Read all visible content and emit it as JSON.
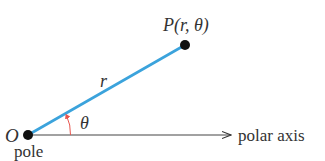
{
  "diagram": {
    "pole": {
      "label": "O",
      "caption": "pole",
      "x": 28,
      "y": 135
    },
    "point": {
      "label": "P(r, θ)",
      "x": 185,
      "y": 45
    },
    "radius": {
      "label": "r",
      "color": "#3ba3dc"
    },
    "angle": {
      "label": "θ",
      "color": "#e8554e"
    },
    "axis": {
      "label": "polar axis",
      "color": "#333333",
      "end_x": 232
    }
  }
}
